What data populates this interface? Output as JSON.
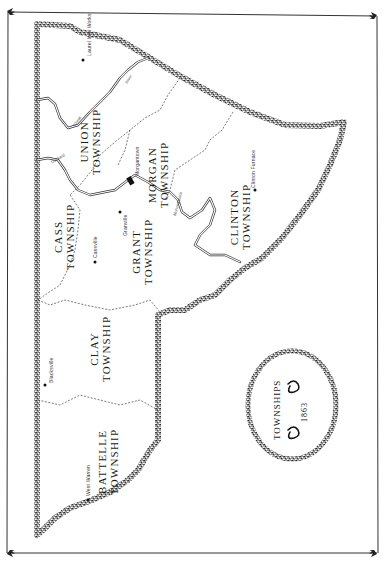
{
  "map": {
    "title": "TOWNSHIPS",
    "year": "1863",
    "colors": {
      "ink": "#1a1a1a",
      "paper": "#ffffff",
      "border_texture": "#6e6e6e"
    },
    "townships": [
      {
        "id": "union",
        "line1": "UNION",
        "line2": "TOWNSHIP"
      },
      {
        "id": "morgan",
        "line1": "MORGAN",
        "line2": "TOWNSHIP"
      },
      {
        "id": "clinton",
        "line1": "CLINTON",
        "line2": "TOWNSHIP"
      },
      {
        "id": "cass",
        "line1": "CASS",
        "line2": "TOWNSHIP"
      },
      {
        "id": "grant",
        "line1": "GRANT",
        "line2": "TOWNSHIP"
      },
      {
        "id": "clay",
        "line1": "CLAY",
        "line2": "TOWNSHIP"
      },
      {
        "id": "battelle",
        "line1": "BATTELLE",
        "line2": "TOWNSHIP"
      }
    ],
    "towns": [
      {
        "id": "laurel-iron-works",
        "name": "Laurel Iron Works"
      },
      {
        "id": "morgantown",
        "name": "Morgantown"
      },
      {
        "id": "granville",
        "name": "Granville"
      },
      {
        "id": "cassville",
        "name": "Cassville"
      },
      {
        "id": "clinton-furnace",
        "name": "Clinton Furnace"
      },
      {
        "id": "blacksville",
        "name": "Blacksville"
      },
      {
        "id": "west-warren",
        "name": "West Warren"
      }
    ],
    "rivers": [
      {
        "id": "cheat-river-a",
        "name": "Cheat"
      },
      {
        "id": "cheat-river-b",
        "name": "River"
      },
      {
        "id": "dunkard",
        "name": "Dunkard"
      },
      {
        "id": "monongahela",
        "name": "Monongahela"
      }
    ]
  }
}
